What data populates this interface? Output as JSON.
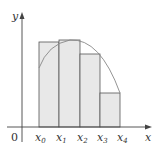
{
  "diagram": {
    "type": "riemann-sum-upper",
    "axes": {
      "x_label": "x",
      "y_label": "y",
      "origin_label": "0"
    },
    "x_ticks": [
      {
        "base": "x",
        "sub": "0"
      },
      {
        "base": "x",
        "sub": "1"
      },
      {
        "base": "x",
        "sub": "2"
      },
      {
        "base": "x",
        "sub": "3"
      },
      {
        "base": "x",
        "sub": "4"
      }
    ],
    "rectangles": [
      {
        "x0": 39,
        "x1": 59,
        "top": 42
      },
      {
        "x0": 59,
        "x1": 80,
        "top": 40
      },
      {
        "x0": 80,
        "x1": 100,
        "top": 54
      },
      {
        "x0": 100,
        "x1": 120,
        "top": 93
      }
    ],
    "colors": {
      "fill": "#e8e8e8",
      "stroke": "#555555",
      "curve": "#888888",
      "axis": "#444444"
    }
  }
}
